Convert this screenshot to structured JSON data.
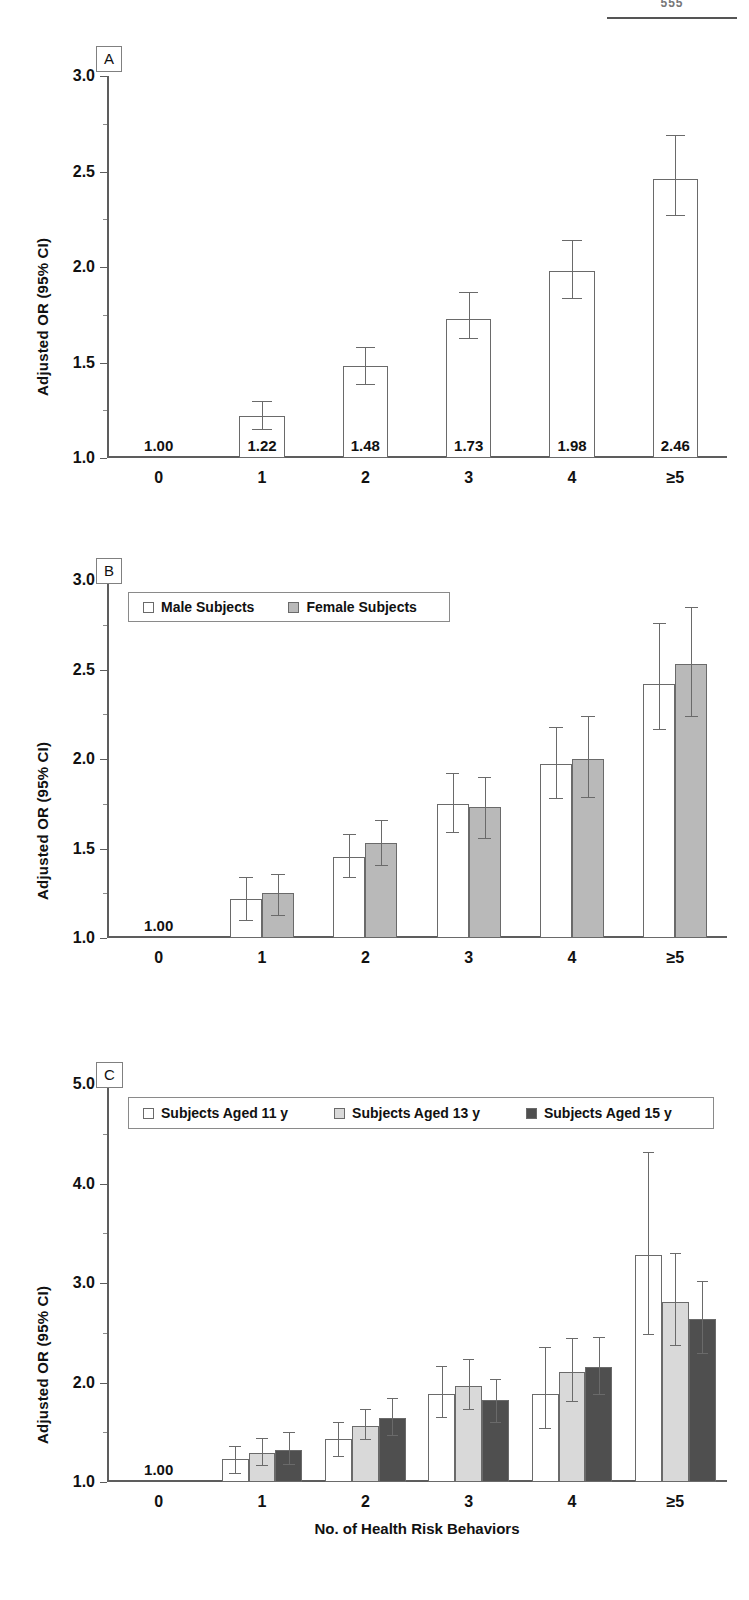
{
  "page": {
    "number": "555"
  },
  "figure": {
    "xlabel": "No. of Health Risk Behaviors",
    "ylabel": "Adjusted OR (95% CI)",
    "categories": [
      "0",
      "1",
      "2",
      "3",
      "4",
      "≥5"
    ]
  },
  "panels": [
    {
      "tag": "A"
    },
    {
      "tag": "B"
    },
    {
      "tag": "C"
    }
  ],
  "legends": {
    "b": [
      {
        "label": "Male Subjects",
        "color": "#ffffff"
      },
      {
        "label": "Female Subjects",
        "color": "#b9b9b9"
      }
    ],
    "c": [
      {
        "label": "Subjects Aged 11 y",
        "color": "#ffffff"
      },
      {
        "label": "Subjects Aged 13 y",
        "color": "#d9d9d9"
      },
      {
        "label": "Subjects Aged 15 y",
        "color": "#4f4f4f"
      }
    ]
  },
  "chart_data": [
    {
      "id": "panel-a",
      "type": "bar",
      "title": "A",
      "xlabel": "No. of Health Risk Behaviors",
      "ylabel": "Adjusted OR (95% CI)",
      "ylim": [
        1.0,
        3.0
      ],
      "yticks": [
        1.0,
        1.5,
        2.0,
        2.5,
        3.0
      ],
      "ytick_labels": [
        "1.0",
        "1.5",
        "2.0",
        "2.5",
        "3.0"
      ],
      "grid": false,
      "legend": null,
      "categories": [
        "0",
        "1",
        "2",
        "3",
        "4",
        "≥5"
      ],
      "values": [
        1.0,
        1.22,
        1.48,
        1.73,
        1.98,
        2.46
      ],
      "data_labels": [
        "1.00",
        "1.22",
        "1.48",
        "1.73",
        "1.98",
        "2.46"
      ],
      "ci_low": [
        null,
        1.15,
        1.39,
        1.63,
        1.84,
        2.27
      ],
      "ci_high": [
        null,
        1.3,
        1.58,
        1.87,
        2.14,
        2.69
      ]
    },
    {
      "id": "panel-b",
      "type": "bar",
      "title": "B",
      "xlabel": "No. of Health Risk Behaviors",
      "ylabel": "Adjusted OR (95% CI)",
      "ylim": [
        1.0,
        3.0
      ],
      "yticks": [
        1.0,
        1.5,
        2.0,
        2.5,
        3.0
      ],
      "ytick_labels": [
        "1.0",
        "1.5",
        "2.0",
        "2.5",
        "3.0"
      ],
      "grid": false,
      "legend_position": "top-left",
      "categories": [
        "0",
        "1",
        "2",
        "3",
        "4",
        "≥5"
      ],
      "reference_label": "1.00",
      "series": [
        {
          "name": "Male Subjects",
          "color": "#ffffff",
          "values": [
            1.0,
            1.22,
            1.45,
            1.75,
            1.97,
            2.42
          ],
          "ci_low": [
            null,
            1.1,
            1.34,
            1.59,
            1.78,
            2.17
          ],
          "ci_high": [
            null,
            1.34,
            1.58,
            1.92,
            2.18,
            2.76
          ]
        },
        {
          "name": "Female Subjects",
          "color": "#b9b9b9",
          "values": [
            1.0,
            1.25,
            1.53,
            1.73,
            2.0,
            2.53
          ],
          "ci_low": [
            null,
            1.13,
            1.41,
            1.56,
            1.79,
            2.24
          ],
          "ci_high": [
            null,
            1.36,
            1.66,
            1.9,
            2.24,
            2.85
          ]
        }
      ]
    },
    {
      "id": "panel-c",
      "type": "bar",
      "title": "C",
      "xlabel": "No. of Health Risk Behaviors",
      "ylabel": "Adjusted OR (95% CI)",
      "ylim": [
        1.0,
        5.0
      ],
      "yticks": [
        1.0,
        2.0,
        3.0,
        4.0,
        5.0
      ],
      "ytick_labels": [
        "1.0",
        "2.0",
        "3.0",
        "4.0",
        "5.0"
      ],
      "grid": false,
      "legend_position": "top-left",
      "categories": [
        "0",
        "1",
        "2",
        "3",
        "4",
        "≥5"
      ],
      "reference_label": "1.00",
      "series": [
        {
          "name": "Subjects Aged 11 y",
          "color": "#ffffff",
          "values": [
            1.0,
            1.23,
            1.43,
            1.88,
            1.88,
            3.28
          ],
          "ci_low": [
            null,
            1.09,
            1.26,
            1.65,
            1.54,
            2.49
          ],
          "ci_high": [
            null,
            1.36,
            1.6,
            2.17,
            2.36,
            4.32
          ]
        },
        {
          "name": "Subjects Aged 13 y",
          "color": "#d9d9d9",
          "values": [
            1.0,
            1.29,
            1.56,
            1.97,
            2.11,
            2.81
          ],
          "ci_low": [
            null,
            1.17,
            1.43,
            1.73,
            1.81,
            2.38
          ],
          "ci_high": [
            null,
            1.44,
            1.73,
            2.24,
            2.45,
            3.3
          ]
        },
        {
          "name": "Subjects Aged 15 y",
          "color": "#4f4f4f",
          "values": [
            1.0,
            1.32,
            1.64,
            1.82,
            2.16,
            2.64
          ],
          "ci_low": [
            null,
            1.18,
            1.47,
            1.6,
            1.88,
            2.3
          ],
          "ci_high": [
            null,
            1.5,
            1.84,
            2.04,
            2.46,
            3.02
          ]
        }
      ]
    }
  ]
}
